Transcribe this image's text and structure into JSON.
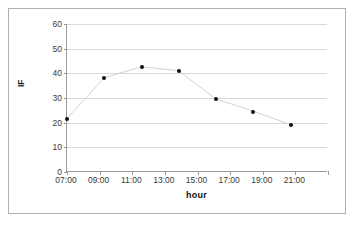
{
  "chart_data": {
    "type": "line",
    "title": "",
    "xlabel": "hour",
    "ylabel": "IF",
    "x": [
      "07:00",
      "09:00",
      "11:00",
      "13:00",
      "15:00",
      "17:00",
      "19:00"
    ],
    "values": [
      21.5,
      38,
      42.5,
      41,
      29.5,
      24.5,
      19
    ],
    "series": [
      {
        "name": "IF",
        "values": [
          21.5,
          38,
          42.5,
          41,
          29.5,
          24.5,
          19
        ]
      }
    ],
    "xticks": [
      "07:00",
      "09:00",
      "11:00",
      "13:00",
      "15:00",
      "17:00",
      "19:00",
      "21:00"
    ],
    "yticks": [
      0,
      10,
      20,
      30,
      40,
      50,
      60
    ],
    "ylim": [
      0,
      60
    ],
    "grid": "horizontal",
    "legend": "none",
    "marker_color": "#101010",
    "line_color": "#d2d2d2",
    "gridline_color": "#d9d9d9",
    "axis_color": "#9a9a9a",
    "border_color": "#b0b0b0",
    "background": "#ffffff"
  }
}
